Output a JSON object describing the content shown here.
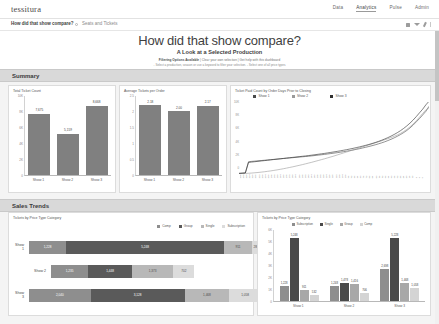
{
  "app": {
    "logo": "tessitura",
    "nav": [
      {
        "label": "Data",
        "active": false
      },
      {
        "label": "Analytics",
        "active": true
      },
      {
        "label": "Pulse",
        "active": false
      },
      {
        "label": "Admin",
        "active": false
      }
    ],
    "tabs": [
      {
        "label": "How did that show compare?",
        "active": true
      },
      {
        "label": "Seats and Tickets",
        "active": false
      }
    ],
    "toolbar_icons": [
      "grid-icon",
      "play-icon",
      "pin-icon",
      "menu-icon"
    ]
  },
  "title": {
    "heading": "How did that show compare?",
    "subheading": "A Look at a Selected Production",
    "filter_line_1_bold": "Filtering Options Available",
    "filter_line_1_rest": "|  Clear your own selection  |  Get help with this dashboard",
    "filter_line_2": "- Select a production, season or use a keyword to filter your selection.  - Select one of all price types"
  },
  "sections": [
    {
      "id": "summary",
      "label": "Summary"
    },
    {
      "id": "trends",
      "label": "Sales Trends"
    }
  ],
  "colors": {
    "bar_gray": "#808080",
    "series_1": "#4a4a4a",
    "series_2": "#9a9a9a",
    "series_3": "#2f2f2f",
    "comp": "#8e8e8e",
    "group": "#5a5a5a",
    "single": "#b8b8b8",
    "subscription": "#dcdcdc",
    "section_bar": "#d9d9d9"
  },
  "chart_data": [
    {
      "id": "total-ticket-count",
      "type": "bar",
      "title": "Total Ticket Count",
      "categories": [
        "Show 1",
        "Show 2",
        "Show 3"
      ],
      "values": [
        7675,
        5159,
        8668
      ],
      "value_labels": [
        "7,675",
        "5,159",
        "8,668"
      ],
      "ylabel": "",
      "xlabel": "",
      "ylim": [
        0,
        10000
      ],
      "yticks": [
        0,
        2000,
        4000,
        6000,
        8000,
        10000
      ],
      "ytick_labels": [
        "0",
        "2K",
        "4K",
        "6K",
        "8K",
        "10K"
      ],
      "grid": false,
      "legend": "none"
    },
    {
      "id": "average-tickets-per-order",
      "type": "bar",
      "title": "Average Tickets per Order",
      "categories": [
        "Show 1",
        "Show 2",
        "Show 3"
      ],
      "values": [
        2.18,
        2.0,
        2.17
      ],
      "value_labels": [
        "2.18",
        "2.00",
        "2.17"
      ],
      "ylabel": "",
      "xlabel": "",
      "ylim": [
        0,
        2.5
      ],
      "yticks": [
        0,
        0.5,
        1,
        1.5,
        2,
        2.5
      ],
      "ytick_labels": [
        "0",
        "0.5",
        "1",
        "1.5",
        "2",
        "2.5"
      ],
      "grid": false,
      "legend": "none"
    },
    {
      "id": "ticket-paid-count-by-days-prior",
      "type": "line",
      "title": "Ticket Paid Count by Order Days Prior to Closing",
      "xlabel": "",
      "ylabel": "",
      "ylim": [
        0,
        10000
      ],
      "yticks": [
        0,
        2000,
        4000,
        6000,
        8000,
        10000
      ],
      "ytick_labels": [
        "0",
        "2K",
        "4K",
        "6K",
        "8K",
        "10K"
      ],
      "legend": "top",
      "x_tick_labels": [
        "240",
        "236",
        "232",
        "228",
        "224",
        "220",
        "216",
        "212",
        "208",
        "204",
        "200",
        "196",
        "192",
        "188",
        "184",
        "180",
        "176",
        "172",
        "168",
        "164",
        "160",
        "156",
        "152",
        "148",
        "144",
        "140",
        "136",
        "132",
        "128",
        "124",
        "120",
        "116",
        "112",
        "108",
        "104",
        "100",
        "96",
        "92",
        "88",
        "84",
        "80",
        "76",
        "72",
        "68",
        "64",
        "60",
        "56",
        "52",
        "48",
        "44",
        "40",
        "36",
        "32",
        "28",
        "24",
        "20",
        "16",
        "12",
        "8",
        "4",
        "0"
      ],
      "series": [
        {
          "name": "Show 1",
          "color": "#4a4a4a",
          "values": [
            90,
            120,
            150,
            1700,
            1750,
            1790,
            1830,
            1870,
            1910,
            1950,
            1990,
            2030,
            2070,
            2110,
            2150,
            2190,
            2230,
            2270,
            2310,
            2350,
            2390,
            2430,
            2470,
            2520,
            2570,
            2620,
            2670,
            2720,
            2780,
            2840,
            2900,
            2960,
            3030,
            3100,
            3170,
            3250,
            3330,
            3420,
            3510,
            3610,
            3710,
            3820,
            3930,
            4050,
            4180,
            4320,
            4470,
            4640,
            4820,
            5020,
            5240,
            5480,
            5750,
            6050,
            6400,
            6800,
            7250,
            7700,
            8200,
            8700,
            9400
          ]
        },
        {
          "name": "Show 2",
          "color": "#9a9a9a",
          "values": [
            40,
            60,
            80,
            100,
            130,
            170,
            210,
            260,
            310,
            370,
            430,
            500,
            570,
            650,
            730,
            820,
            910,
            1000,
            1100,
            1200,
            1300,
            1410,
            1520,
            1630,
            1750,
            1870,
            1990,
            2110,
            2240,
            2370,
            2500,
            2640,
            2780,
            2920,
            3060,
            3200,
            3340,
            3480,
            3620,
            3760,
            3900,
            4040,
            4180,
            4320,
            4460,
            4600,
            4750,
            4900,
            5060,
            5230,
            5420,
            5640,
            5900,
            6200,
            6550,
            6950,
            7400,
            7900,
            8400,
            8900,
            9200
          ]
        },
        {
          "name": "Show 3",
          "color": "#2f2f2f",
          "values": [
            80,
            110,
            140,
            1600,
            1660,
            1710,
            1760,
            1810,
            1860,
            1910,
            1960,
            2010,
            2060,
            2110,
            2160,
            2210,
            2260,
            2310,
            2360,
            2410,
            2460,
            2510,
            2560,
            2620,
            2680,
            2740,
            2800,
            2860,
            2930,
            3000,
            3070,
            3140,
            3220,
            3300,
            3380,
            3470,
            3560,
            3660,
            3760,
            3870,
            3980,
            4100,
            4230,
            4370,
            4520,
            4680,
            4860,
            5050,
            5260,
            5490,
            5740,
            6020,
            6330,
            6680,
            7070,
            7500,
            7980,
            8500,
            9000,
            9600,
            10100
          ]
        }
      ]
    },
    {
      "id": "tickets-by-price-type-category-stacked",
      "type": "bar",
      "orientation": "horizontal",
      "stacked": true,
      "title": "Tickets by Price Type Category",
      "categories": [
        "Show 1",
        "Show 2",
        "Show 3"
      ],
      "legend": "top-right",
      "series": [
        {
          "name": "Comp",
          "color": "#8e8e8e",
          "values": [
            1228,
            1235,
            2040
          ],
          "labels": [
            "1,228",
            "1,235",
            "2,040"
          ]
        },
        {
          "name": "Group",
          "color": "#5a5a5a",
          "values": [
            5248,
            1448,
            3128
          ],
          "labels": [
            "5,248",
            "1,448",
            "3,128"
          ]
        },
        {
          "name": "Single",
          "color": "#b8b8b8",
          "values": [
            911,
            1373,
            1468
          ],
          "labels": [
            "911",
            "1,373",
            "1,468"
          ]
        },
        {
          "name": "Subscription",
          "color": "#dcdcdc",
          "values": [
            288,
            702,
            1058
          ],
          "labels": [
            "288",
            "702",
            "1,058"
          ]
        }
      ]
    },
    {
      "id": "tickets-by-price-type-category-grouped",
      "type": "bar",
      "orientation": "vertical",
      "grouped": true,
      "title": "Tickets by Price Type Category",
      "categories": [
        "Show 1",
        "Show 2",
        "Show 3"
      ],
      "ylim": [
        0,
        6000
      ],
      "yticks": [
        0,
        1000,
        2000,
        3000,
        4000,
        5000,
        6000
      ],
      "ytick_labels": [
        "0",
        "1K",
        "2K",
        "3K",
        "4K",
        "5K",
        "6K"
      ],
      "legend": "top",
      "series": [
        {
          "name": "Subscription",
          "color": "#8e8e8e",
          "values": [
            1228,
            1248,
            2698
          ],
          "labels": [
            "1,228",
            "1,248",
            "2,698"
          ]
        },
        {
          "name": "Single",
          "color": "#4a4a4a",
          "values": [
            5248,
            1478,
            5228
          ],
          "labels": [
            "5,248",
            "1,478",
            "5,228"
          ]
        },
        {
          "name": "Group",
          "color": "#a8a8a8",
          "values": [
            911,
            1416,
            1468
          ],
          "labels": [
            "911",
            "1,416",
            "1,468"
          ]
        },
        {
          "name": "Comp",
          "color": "#d4d4d4",
          "values": [
            532,
            706,
            1058
          ],
          "labels": [
            "532",
            "706",
            "1,058"
          ]
        }
      ]
    }
  ]
}
